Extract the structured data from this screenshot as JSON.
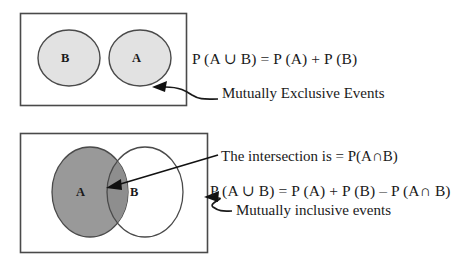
{
  "figure": {
    "title_semantic": "venn-diagram-probability-rules",
    "colors": {
      "stroke": "#333333",
      "box_stroke": "#444444",
      "light_fill": "#e2e2e2",
      "dark_fill": "#999999",
      "white_fill": "#ffffff",
      "text": "#1a1a1a",
      "background": "#ffffff"
    }
  },
  "panels": [
    {
      "id": "mutually-exclusive",
      "sets": [
        {
          "name": "set-b",
          "label": "B",
          "fill": "#e2e2e2"
        },
        {
          "name": "set-a",
          "label": "A",
          "fill": "#e2e2e2"
        }
      ],
      "formula": "P (A ∪ B) = P (A) + P (B)",
      "caption": "Mutually Exclusive Events",
      "annotation_target": "sample-space-box"
    },
    {
      "id": "mutually-inclusive",
      "sets": [
        {
          "name": "set-a",
          "label": "A",
          "fill": "#999999"
        },
        {
          "name": "set-b",
          "label": "B",
          "fill": "#ffffff"
        }
      ],
      "formula": "P (A ∪ B) = P (A) + P (B) – P (A∩ B)",
      "caption": "Mutually inclusive events",
      "intersection_label": "The intersection is = P(A∩B)",
      "annotation_target": "intersection-region"
    }
  ]
}
